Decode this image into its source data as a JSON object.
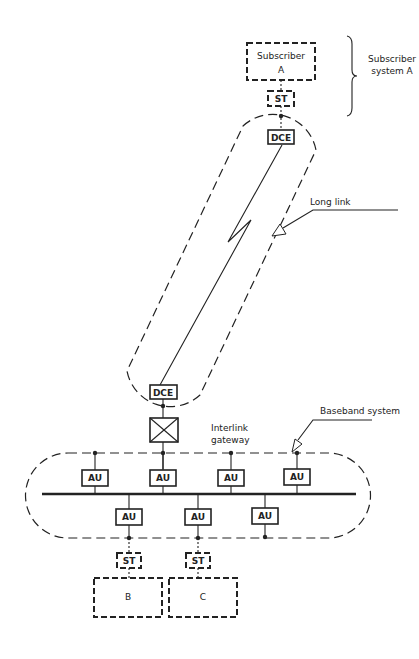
{
  "diagram": {
    "subscriber_a": {
      "line1": "Subscriber",
      "line2": "A"
    },
    "subscriber_system_a": {
      "line1": "Subscriber",
      "line2": "system A"
    },
    "st_labels": [
      "ST",
      "ST",
      "ST"
    ],
    "dce_labels": [
      "DCE",
      "DCE"
    ],
    "long_link": "Long link",
    "interlink_gateway": {
      "line1": "Interlink",
      "line2": "gateway"
    },
    "baseband_system": "Baseband system",
    "au_upper": [
      "AU",
      "AU",
      "AU",
      "AU"
    ],
    "au_lower": [
      "AU",
      "AU",
      "AU"
    ],
    "subscriber_b": "B",
    "subscriber_c": "C",
    "colors": {
      "ink": "#222222",
      "background": "#ffffff"
    }
  }
}
